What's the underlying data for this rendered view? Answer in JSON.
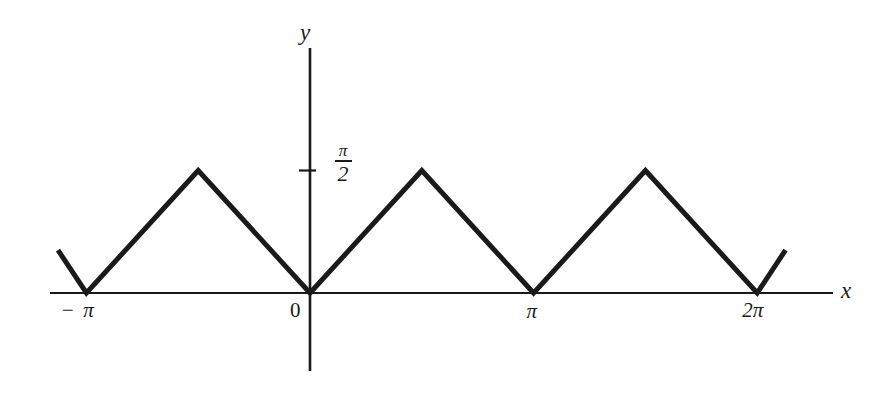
{
  "figure": {
    "title": "",
    "background_color": "#ffffff",
    "stroke_color": "#1a1a1a"
  },
  "axes": {
    "x_axis_label": "x",
    "y_axis_label": "y",
    "x_tick_labels": [
      "− π",
      "0",
      "π",
      "2π"
    ],
    "y_tick_label_numerator": "π",
    "y_tick_label_denominator": "2"
  },
  "chart_data": {
    "type": "line",
    "title": "",
    "xlabel": "x",
    "ylabel": "y",
    "grid": false,
    "legend": null,
    "xlim": [
      -3.6,
      7.4
    ],
    "ylim": [
      -0.55,
      2.6
    ],
    "xtick_values": [
      -3.14159,
      0,
      3.14159,
      6.28319
    ],
    "xtick_labels": [
      "− π",
      "0",
      "π",
      "2π"
    ],
    "ytick_values": [
      1.5708
    ],
    "ytick_labels": [
      "π/2"
    ],
    "series": [
      {
        "name": "f(x)",
        "x": [
          -3.54,
          -3.14159,
          -1.5708,
          0,
          1.5708,
          3.14159,
          4.71239,
          6.28319,
          6.68
        ],
        "y": [
          0.55,
          0,
          1.5708,
          0,
          1.5708,
          0,
          1.5708,
          0,
          0.55
        ]
      }
    ],
    "peak_value": 1.5708,
    "trough_value": 0,
    "period": 3.14159
  }
}
